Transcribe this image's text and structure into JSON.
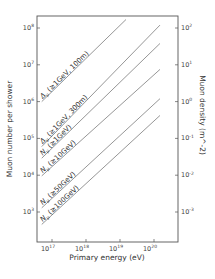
{
  "chart_data": {
    "type": "line",
    "title": "",
    "xlabel": "Primary energy (eV)",
    "ylabel": "Muon number per shower",
    "y2label": "Muon density (m^-2)",
    "xscale": "log",
    "yscale": "log",
    "xlim": [
      5e+16,
      3e+20
    ],
    "ylim": [
      150.0,
      300000000.0
    ],
    "y2lim": [
      0.0015,
      300.0
    ],
    "grid": false,
    "legend_position": "inline labels along lines",
    "x_ticks": [
      {
        "base": "10",
        "exp": "17"
      },
      {
        "base": "10",
        "exp": "18"
      },
      {
        "base": "10",
        "exp": "19"
      },
      {
        "base": "10",
        "exp": "20"
      }
    ],
    "y_ticks": [
      {
        "base": "10",
        "exp": "8"
      },
      {
        "base": "10",
        "exp": "7"
      },
      {
        "base": "10",
        "exp": "6"
      },
      {
        "base": "10",
        "exp": "5"
      },
      {
        "base": "10",
        "exp": "4"
      },
      {
        "base": "10",
        "exp": "3"
      }
    ],
    "y2_ticks": [
      {
        "base": "10",
        "exp": "2"
      },
      {
        "base": "10",
        "exp": "1"
      },
      {
        "base": "10",
        "exp": "0"
      },
      {
        "base": "10",
        "exp": "-1"
      },
      {
        "base": "10",
        "exp": "-2"
      },
      {
        "base": "10",
        "exp": "-3"
      }
    ],
    "series": [
      {
        "name": "Δμ (≥1GeV, 100m)",
        "axis": "right",
        "label_sym": "Δ",
        "label_sub": "μ",
        "label_rest": " (≥1GeV, 100m)",
        "x": [
          5e+16,
          1.5e+19
        ],
        "y": [
          1.0,
          170
        ]
      },
      {
        "name": "Δμ (≥1GeV, 300m)",
        "axis": "right",
        "label_sym": "Δ",
        "label_sub": "μ",
        "label_rest": " (≥1GeV, 300m)",
        "x": [
          5e+16,
          1.5e+20
        ],
        "y": [
          0.06,
          120
        ]
      },
      {
        "name": "Nμ (≥1GeV)",
        "axis": "left",
        "label_sym": "N",
        "label_sub": "μ",
        "label_rest": " (≥1GeV)",
        "x": [
          5e+16,
          1.5e+20
        ],
        "y": [
          29000.0,
          38000000.0
        ]
      },
      {
        "name": "Nμ (≥10GeV)",
        "axis": "left",
        "label_sym": "N",
        "label_sub": "μ",
        "label_rest": " (≥10GeV)",
        "x": [
          5e+16,
          1.5e+20
        ],
        "y": [
          9600.0,
          7500000.0
        ]
      },
      {
        "name": "Nμ (≥50GeV)",
        "axis": "left",
        "label_sym": "N",
        "label_sub": "μ",
        "label_rest": " (≥50GeV)",
        "x": [
          5e+16,
          1.5e+20
        ],
        "y": [
          1300.0,
          1200000.0
        ]
      },
      {
        "name": "Nμ (≥100GeV)",
        "axis": "left",
        "label_sym": "N",
        "label_sub": "μ",
        "label_rest": " (≥100GeV)",
        "x": [
          5e+16,
          1.5e+20
        ],
        "y": [
          460.0,
          420000.0
        ]
      }
    ]
  }
}
